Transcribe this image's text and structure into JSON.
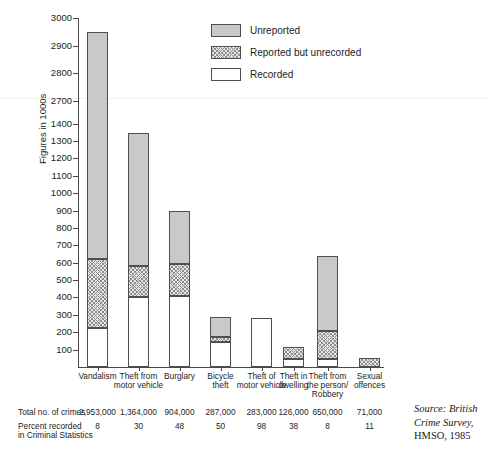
{
  "chart_data": {
    "type": "bar",
    "stacked": true,
    "title": "",
    "xlabel": "",
    "ylabel": "Figures in 1000s",
    "grid": false,
    "legend_position": "top-right",
    "axis_break": true,
    "ylim": [
      0,
      3000
    ],
    "ytick_labels": [
      "100",
      "200",
      "300",
      "400",
      "500",
      "600",
      "700",
      "800",
      "900",
      "1000",
      "1100",
      "1200",
      "1300",
      "1400",
      "2700",
      "2800",
      "2900",
      "3000"
    ],
    "categories": [
      "Vandalism",
      "Theft from motor vehicle",
      "Burglary",
      "Bicycle theft",
      "Theft of motor vehicle",
      "Theft in dwelling",
      "Theft from the person/ Robbery",
      "Sexual offences"
    ],
    "series": [
      {
        "name": "Recorded",
        "values": [
          225,
          400,
          410,
          145,
          280,
          45,
          45,
          0
        ]
      },
      {
        "name": "Reported but unrecorded",
        "values": [
          395,
          180,
          185,
          30,
          0,
          70,
          160,
          50
        ]
      },
      {
        "name": "Unreported",
        "values": [
          2330,
          765,
          305,
          110,
          0,
          0,
          435,
          0
        ]
      }
    ],
    "totals": [
      2950,
      1345,
      900,
      285,
      280,
      115,
      640,
      50
    ],
    "annotations": {
      "total_crimes": [
        "2,953,000",
        "1,364,000",
        "904,000",
        "287,000",
        "283,000",
        "126,000",
        "650,000",
        "71,000"
      ],
      "percent_recorded": [
        "8",
        "30",
        "48",
        "50",
        "98",
        "38",
        "8",
        "11"
      ]
    }
  },
  "legend": {
    "items": [
      {
        "label": "Unreported",
        "swatch": "solid-gray",
        "color": "#c9c9c9"
      },
      {
        "label": "Reported but unrecorded",
        "swatch": "crosshatch",
        "color": "#e7e7e7"
      },
      {
        "label": "Recorded",
        "swatch": "white",
        "color": "#ffffff"
      }
    ]
  },
  "axis": {
    "y_title": "Figures in 1000s",
    "y_ticks": [
      {
        "label": "100"
      },
      {
        "label": "200"
      },
      {
        "label": "300"
      },
      {
        "label": "400"
      },
      {
        "label": "500"
      },
      {
        "label": "600"
      },
      {
        "label": "700"
      },
      {
        "label": "800"
      },
      {
        "label": "900"
      },
      {
        "label": "1000"
      },
      {
        "label": "1100"
      },
      {
        "label": "1200"
      },
      {
        "label": "1300"
      },
      {
        "label": "1400"
      },
      {
        "label": "2700"
      },
      {
        "label": "2800"
      },
      {
        "label": "2900"
      },
      {
        "label": "3000"
      }
    ]
  },
  "categories": [
    {
      "line1": "Vandalism",
      "line2": "",
      "line3": ""
    },
    {
      "line1": "Theft from",
      "line2": "motor vehicle",
      "line3": ""
    },
    {
      "line1": "Burglary",
      "line2": "",
      "line3": ""
    },
    {
      "line1": "Bicycle",
      "line2": "theft",
      "line3": ""
    },
    {
      "line1": "Theft of",
      "line2": "motor vehicle",
      "line3": ""
    },
    {
      "line1": "Theft in",
      "line2": "dwelling",
      "line3": ""
    },
    {
      "line1": "Theft from",
      "line2": "the person/",
      "line3": "Robbery"
    },
    {
      "line1": "Sexual",
      "line2": "offences",
      "line3": ""
    }
  ],
  "table": {
    "rows": [
      {
        "label_line1": "Total no. of crimes",
        "label_line2": "",
        "values": [
          "2,953,000",
          "1,364,000",
          "904,000",
          "287,000",
          "283,000",
          "126,000",
          "650,000",
          "71,000"
        ]
      },
      {
        "label_line1": "Percent recorded",
        "label_line2": "in Criminal Statistics",
        "values": [
          "8",
          "30",
          "48",
          "50",
          "98",
          "38",
          "8",
          "11"
        ]
      }
    ]
  },
  "source": {
    "line1": "Source: British",
    "line2": "Crime Survey,",
    "line3": "HMSO, 1985"
  }
}
